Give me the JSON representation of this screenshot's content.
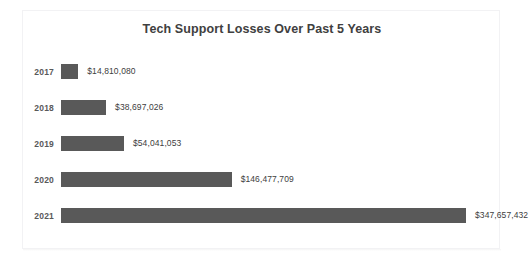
{
  "clipped_top_text": "  .        .              .                      .                  .              .     ",
  "chart_data": {
    "type": "bar",
    "orientation": "horizontal",
    "title": "Tech Support Losses Over Past 5 Years",
    "xlabel": "",
    "ylabel": "",
    "categories": [
      "2017",
      "2018",
      "2019",
      "2020",
      "2021"
    ],
    "values": [
      14810080,
      38697026,
      54041053,
      146477709,
      347657432
    ],
    "value_labels": [
      "$14,810,080",
      "$38,697,026",
      "$54,041,053",
      "$146,477,709",
      "$347,657,432"
    ],
    "xlim": [
      0,
      347657432
    ],
    "grid": false,
    "legend": false,
    "bar_color": "#595959",
    "label_color": "#404040",
    "category_color": "#595959",
    "background_color": "#ffffff"
  }
}
